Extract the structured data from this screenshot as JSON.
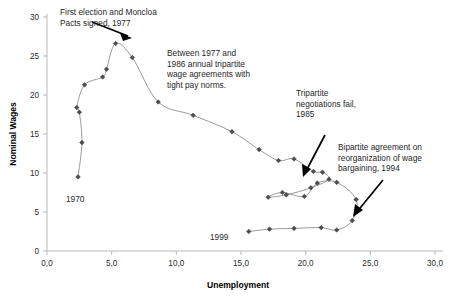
{
  "chart_data": {
    "type": "line",
    "title": "",
    "xlabel": "Unemployment",
    "ylabel": "Nominal Wages",
    "xlim": [
      0.0,
      30.0
    ],
    "ylim": [
      0,
      30
    ],
    "grid": false,
    "legend": "none",
    "x_ticks": [
      "0,0",
      "5,0",
      "10,0",
      "15,0",
      "20,0",
      "25,0",
      "30,0"
    ],
    "x_tick_values": [
      0,
      5,
      10,
      15,
      20,
      25,
      30
    ],
    "y_ticks": [
      "0",
      "5",
      "10",
      "15",
      "20",
      "25",
      "30"
    ],
    "y_tick_values": [
      0,
      5,
      10,
      15,
      20,
      25,
      30
    ],
    "series": [
      {
        "name": "Spain nominal wages vs unemployment, 1970-1999",
        "points": [
          [
            2.4,
            9.5
          ],
          [
            2.7,
            13.9
          ],
          [
            2.5,
            17.8
          ],
          [
            2.3,
            18.4
          ],
          [
            2.9,
            21.3
          ],
          [
            4.3,
            22.3
          ],
          [
            4.6,
            23.3
          ],
          [
            5.3,
            26.6
          ],
          [
            6.6,
            24.8
          ],
          [
            8.6,
            19.1
          ],
          [
            11.3,
            17.4
          ],
          [
            14.3,
            15.3
          ],
          [
            16.4,
            13.0
          ],
          [
            17.9,
            11.6
          ],
          [
            19.1,
            11.8
          ],
          [
            20.6,
            10.2
          ],
          [
            21.3,
            10.1
          ],
          [
            21.8,
            9.2
          ],
          [
            20.4,
            8.1
          ],
          [
            18.5,
            7.2
          ],
          [
            17.1,
            6.9
          ],
          [
            18.2,
            7.5
          ],
          [
            19.9,
            7.0
          ],
          [
            20.9,
            8.7
          ],
          [
            22.4,
            8.8
          ],
          [
            23.9,
            6.6
          ],
          [
            23.6,
            3.9
          ],
          [
            22.4,
            2.7
          ],
          [
            21.2,
            3.0
          ],
          [
            19.1,
            2.9
          ],
          [
            17.2,
            2.8
          ],
          [
            15.6,
            2.5
          ]
        ]
      }
    ],
    "annotations": [
      {
        "name": "moncloa-pacts-annotation",
        "text": "First election and Moncloa\nPacts signed, 1977",
        "x_px": 60,
        "y_px": 7
      },
      {
        "name": "tripartite-agreements-annotation",
        "text": "Between 1977 and\n1986 annual tripartite\nwage agreements with\ntight pay norms.",
        "x_px": 167,
        "y_px": 48
      },
      {
        "name": "tripartite-fail-annotation",
        "text": "Tripartite\nnegotiations fail,\n1985",
        "x_px": 296,
        "y_px": 88
      },
      {
        "name": "bipartite-agreement-annotation",
        "text": "Bipartite agreement on\nreorganization of wage\nbargaining, 1994",
        "x_px": 338,
        "y_px": 142
      }
    ],
    "point_labels": [
      {
        "name": "label-1970",
        "text": "1970",
        "x_px": 66,
        "y_px": 194
      },
      {
        "name": "label-1999",
        "text": "1999",
        "x_px": 210,
        "y_px": 232
      }
    ]
  }
}
